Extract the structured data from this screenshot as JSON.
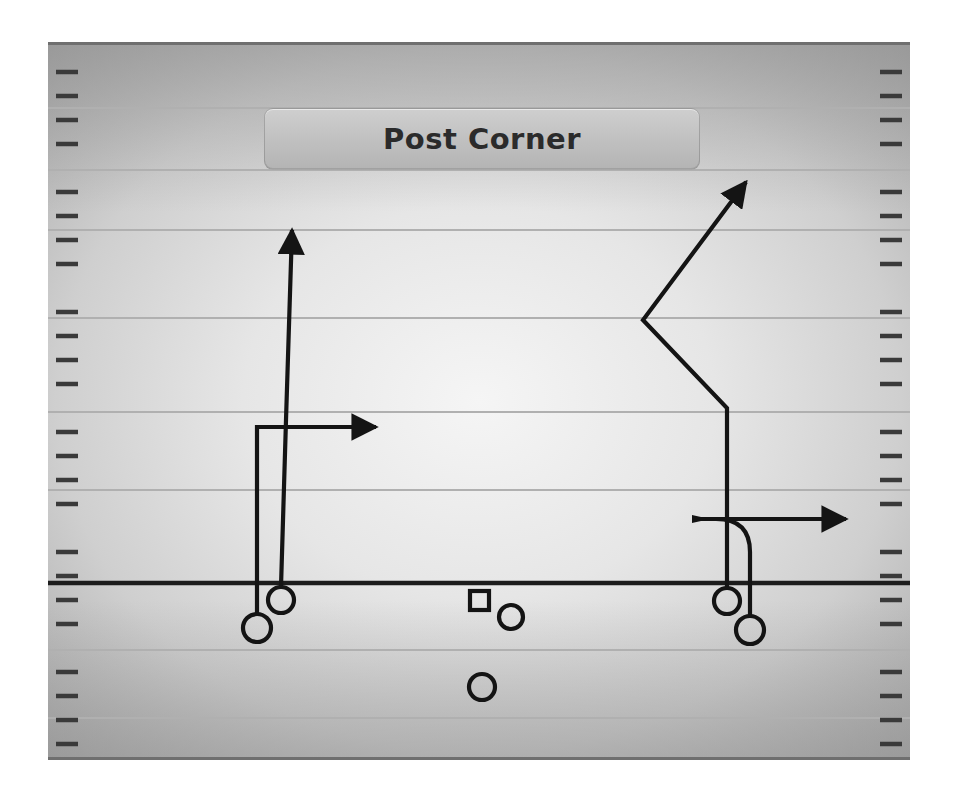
{
  "title": {
    "text": "Post Corner"
  },
  "colors": {
    "field_light": "#f2f2f2",
    "field_mid": "#d6d6d6",
    "field_dark": "#9e9e9e",
    "yard_line": "#b8b8b8",
    "scrimmage_line": "#1c1c1c",
    "route_stroke": "#141414",
    "player_stroke": "#141414",
    "banner_face": "#c4c4c4",
    "banner_text": "#2b2b2b",
    "page_background": "#ffffff"
  },
  "field": {
    "label": "football-field",
    "left": 48,
    "top": 42,
    "right": 910,
    "bottom": 760,
    "yard_lines": [
      108,
      170,
      230,
      318,
      412,
      490,
      650,
      718
    ],
    "scrimmage_y": 583,
    "hash_spacing": 24,
    "hash_length": 22,
    "hash_inset": 6
  },
  "players": [
    {
      "name": "receiver-left-wide",
      "shape": "circle",
      "x": 257,
      "y": 628,
      "r": 14,
      "role": "left outside receiver"
    },
    {
      "name": "receiver-left-slot",
      "shape": "circle",
      "x": 281,
      "y": 600,
      "r": 13,
      "role": "left slot receiver on line"
    },
    {
      "name": "center",
      "shape": "square",
      "x": 479,
      "y": 600,
      "size": 20,
      "role": "center"
    },
    {
      "name": "quarterback",
      "shape": "circle",
      "x": 511,
      "y": 617,
      "r": 12,
      "role": "quarterback"
    },
    {
      "name": "running-back",
      "shape": "circle",
      "x": 482,
      "y": 687,
      "r": 13,
      "role": "running back"
    },
    {
      "name": "receiver-right-slot",
      "shape": "circle",
      "x": 727,
      "y": 601,
      "r": 13,
      "role": "right slot receiver on line"
    },
    {
      "name": "receiver-right-wide",
      "shape": "circle",
      "x": 750,
      "y": 630,
      "r": 14,
      "role": "right outside receiver"
    }
  ],
  "routes": [
    {
      "name": "route-left-wide-out",
      "path": "M 257 614 L 257 427 L 378 427",
      "arrow": {
        "x": 385,
        "y": 427,
        "direction": "right"
      },
      "description": "stem upfield then break out to the right"
    },
    {
      "name": "route-left-slot-go",
      "path": "M 281 587 L 286 420 L 293 228",
      "arrow": {
        "x": 294,
        "y": 218,
        "direction": "up"
      },
      "description": "vertical seam route straight upfield"
    },
    {
      "name": "route-right-slot-post-corner",
      "path": "M 727 588 L 727 408 L 643 320 L 748 180",
      "arrow": {
        "x": 755,
        "y": 172,
        "direction": "up-right"
      },
      "description": "stem upfield, post break inside, then corner break outside"
    },
    {
      "name": "route-right-wide-curl-out",
      "path": "M 750 616 L 750 552 Q 750 519 716 519 L 693 519 M 693 519 L 848 519",
      "arrow": {
        "x": 855,
        "y": 519,
        "direction": "right"
      },
      "flag": {
        "x": 692,
        "y": 519,
        "direction": "left"
      },
      "description": "curl inside then break out to the right"
    }
  ]
}
